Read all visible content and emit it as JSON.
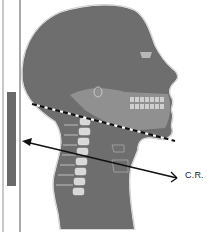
{
  "diagram": {
    "labels": {
      "central_ray": "C.R."
    },
    "elements": [
      {
        "name": "image-receptor",
        "description": "vertical grey bar representing the image receptor"
      },
      {
        "name": "receptor-lines",
        "description": "two thin vertical lines at left"
      },
      {
        "name": "head-neck-silhouette",
        "description": "lateral profile of head and neck with cervical spine"
      },
      {
        "name": "infraorbitomeatal-dashed-line",
        "description": "dashed line along mandible"
      },
      {
        "name": "central-ray-arrow",
        "description": "arrow from right pointing left toward receptor"
      }
    ],
    "colors": {
      "silhouette": "#6e6e6e",
      "outline": "#ffffff",
      "receptor": "#6a6a6a",
      "arrow": "#111111",
      "bone": "#d8d8d8"
    }
  }
}
